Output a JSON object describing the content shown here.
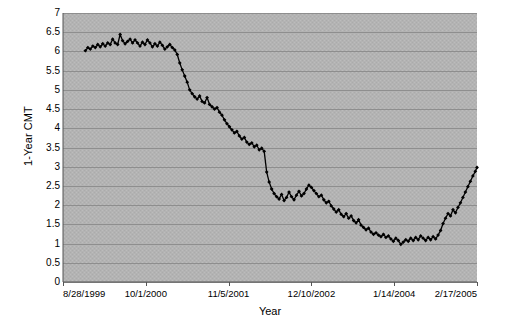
{
  "chart_data": {
    "type": "line",
    "title": "",
    "xlabel": "Year",
    "ylabel": "1-Year CMT",
    "ylim": [
      0,
      7
    ],
    "ytick_step": 0.5,
    "yticks": [
      "7",
      "6.5",
      "6",
      "5.5",
      "5",
      "4.5",
      "4",
      "3.5",
      "3",
      "2.5",
      "2",
      "1.5",
      "1",
      "0.5",
      "0"
    ],
    "xticks": [
      "8/28/1999",
      "10/1/2000",
      "11/5/2001",
      "12/10/2002",
      "1/14/2004",
      "2/17/2005"
    ],
    "grid": "horizontal",
    "legend": "none",
    "marker": "filled-diamond",
    "series_name": "1-Year CMT",
    "series_color": "#000000",
    "plot_background": "#b3b3b3",
    "gridline_color": "#8a8a8a",
    "x_start": "8/28/1999",
    "x_end": "2/17/2005",
    "x": [
      0.054,
      0.06,
      0.066,
      0.072,
      0.078,
      0.084,
      0.09,
      0.096,
      0.102,
      0.108,
      0.114,
      0.12,
      0.126,
      0.132,
      0.138,
      0.144,
      0.15,
      0.156,
      0.162,
      0.168,
      0.174,
      0.18,
      0.186,
      0.192,
      0.198,
      0.204,
      0.21,
      0.216,
      0.222,
      0.228,
      0.234,
      0.24,
      0.246,
      0.252,
      0.258,
      0.264,
      0.27,
      0.276,
      0.282,
      0.288,
      0.294,
      0.3,
      0.306,
      0.312,
      0.318,
      0.324,
      0.33,
      0.336,
      0.342,
      0.348,
      0.354,
      0.36,
      0.366,
      0.372,
      0.378,
      0.384,
      0.39,
      0.396,
      0.402,
      0.408,
      0.414,
      0.42,
      0.426,
      0.432,
      0.438,
      0.444,
      0.45,
      0.456,
      0.462,
      0.468,
      0.474,
      0.48,
      0.486,
      0.492,
      0.498,
      0.504,
      0.51,
      0.516,
      0.522,
      0.528,
      0.534,
      0.54,
      0.546,
      0.552,
      0.558,
      0.564,
      0.57,
      0.576,
      0.582,
      0.588,
      0.594,
      0.6,
      0.606,
      0.612,
      0.618,
      0.624,
      0.63,
      0.636,
      0.642,
      0.648,
      0.654,
      0.66,
      0.666,
      0.672,
      0.678,
      0.684,
      0.69,
      0.696,
      0.702,
      0.708,
      0.714,
      0.72,
      0.726,
      0.732,
      0.738,
      0.744,
      0.75,
      0.756,
      0.762,
      0.768,
      0.774,
      0.78,
      0.786,
      0.792,
      0.798,
      0.804,
      0.81,
      0.816,
      0.822,
      0.828,
      0.834,
      0.84,
      0.846,
      0.852,
      0.858,
      0.864,
      0.87,
      0.876,
      0.882,
      0.888,
      0.894,
      0.9,
      0.906,
      0.912,
      0.918,
      0.924,
      0.93,
      0.936,
      0.942,
      0.948,
      0.954,
      0.96,
      0.966,
      0.972,
      0.978,
      0.984,
      0.99,
      0.996,
      1.0
    ],
    "values": [
      6.02,
      6.1,
      6.06,
      6.14,
      6.1,
      6.18,
      6.12,
      6.2,
      6.14,
      6.22,
      6.18,
      6.32,
      6.22,
      6.18,
      6.44,
      6.28,
      6.2,
      6.26,
      6.32,
      6.22,
      6.3,
      6.22,
      6.14,
      6.24,
      6.18,
      6.3,
      6.22,
      6.12,
      6.2,
      6.14,
      6.24,
      6.16,
      6.06,
      6.12,
      6.18,
      6.1,
      6.04,
      5.92,
      5.7,
      5.52,
      5.36,
      5.2,
      5.0,
      4.9,
      4.82,
      4.76,
      4.84,
      4.7,
      4.66,
      4.8,
      4.62,
      4.56,
      4.5,
      4.54,
      4.42,
      4.34,
      4.22,
      4.12,
      4.04,
      3.96,
      3.88,
      3.92,
      3.8,
      3.72,
      3.76,
      3.64,
      3.58,
      3.62,
      3.52,
      3.56,
      3.44,
      3.48,
      3.4,
      2.86,
      2.6,
      2.42,
      2.3,
      2.22,
      2.16,
      2.28,
      2.12,
      2.2,
      2.34,
      2.22,
      2.14,
      2.26,
      2.36,
      2.24,
      2.3,
      2.42,
      2.52,
      2.46,
      2.38,
      2.3,
      2.22,
      2.26,
      2.14,
      2.06,
      2.1,
      1.98,
      1.9,
      1.82,
      1.88,
      1.76,
      1.7,
      1.78,
      1.66,
      1.72,
      1.6,
      1.54,
      1.62,
      1.48,
      1.42,
      1.36,
      1.4,
      1.3,
      1.24,
      1.28,
      1.22,
      1.18,
      1.24,
      1.16,
      1.2,
      1.12,
      1.06,
      1.14,
      1.08,
      0.98,
      1.04,
      1.1,
      1.06,
      1.14,
      1.08,
      1.16,
      1.1,
      1.2,
      1.14,
      1.08,
      1.16,
      1.1,
      1.18,
      1.12,
      1.22,
      1.34,
      1.52,
      1.66,
      1.78,
      1.72,
      1.88,
      1.8,
      1.94,
      2.06,
      2.2,
      2.34,
      2.48,
      2.62,
      2.76,
      2.88,
      2.98
    ]
  }
}
